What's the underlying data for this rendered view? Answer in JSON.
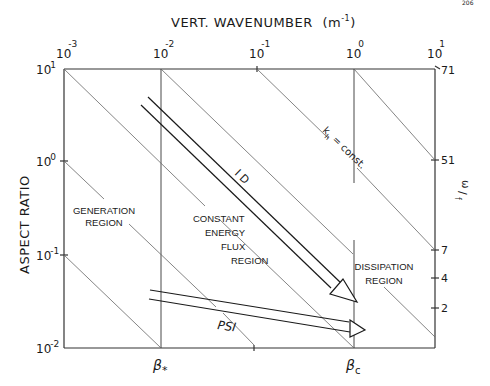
{
  "page_number": "206",
  "top_axis": {
    "title": "VERT. WAVENUMBER",
    "unit_base": "(m",
    "unit_exp": "-1",
    "unit_close": ")",
    "ticks": [
      {
        "base": "10",
        "exp": "-3"
      },
      {
        "base": "10",
        "exp": "-2"
      },
      {
        "base": "10",
        "exp": "-1"
      },
      {
        "base": "10",
        "exp": "0"
      },
      {
        "base": "10",
        "exp": "1"
      }
    ]
  },
  "left_axis": {
    "title": "ASPECT RATIO",
    "ticks": [
      {
        "base": "10",
        "exp": "1"
      },
      {
        "base": "10",
        "exp": "0"
      },
      {
        "base": "10",
        "exp": "-1"
      },
      {
        "base": "10",
        "exp": "-2"
      }
    ]
  },
  "right_axis": {
    "title_num": "ω",
    "title_den": "f",
    "ticks": [
      "71",
      "51",
      "7",
      "4",
      "2"
    ]
  },
  "bottom_axis": {
    "beta_star": {
      "symbol": "β",
      "sub": "*"
    },
    "beta_c": {
      "symbol": "β",
      "sub": "c"
    }
  },
  "regions": {
    "generation": [
      "GENERATION",
      "REGION"
    ],
    "constant_flux": [
      "CONSTANT",
      "ENERGY",
      "FLUX",
      "REGION"
    ],
    "dissipation": [
      "DISSIPATION",
      "REGION"
    ]
  },
  "annotations": {
    "kh_base": "k",
    "kh_sub": "h",
    "kh_rest": " = const.",
    "id_arrow": "I D",
    "psi_arrow": "PSI"
  },
  "colors": {
    "ink": "#1a1a1a",
    "grid": "#333333",
    "diagonal": "#555555"
  }
}
